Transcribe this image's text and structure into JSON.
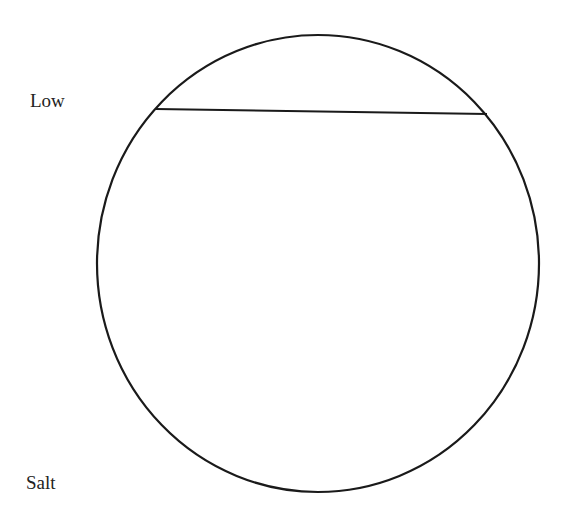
{
  "diagram": {
    "labels": {
      "top": "Low",
      "bottom": "Salt"
    },
    "shapes": {
      "circle": {
        "cx": 318,
        "cy": 263.5,
        "rx": 221,
        "ry": 228.5,
        "stroke": "#1a1a1a"
      },
      "chord": {
        "x1": 156,
        "y1": 109,
        "x2": 487,
        "y2": 114,
        "stroke": "#1a1a1a"
      }
    }
  }
}
